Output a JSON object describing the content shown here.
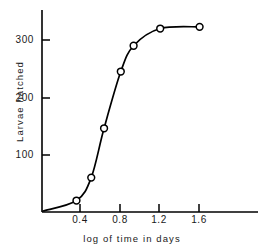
{
  "chart_data": {
    "type": "line",
    "title": "",
    "subtitle": "",
    "xlabel": "log of time in days",
    "ylabel": "Larvae hatched",
    "xlim": [
      0.0,
      1.78
    ],
    "ylim": [
      0,
      368
    ],
    "grid": false,
    "legend": null,
    "marker": "open-circle",
    "line_color": "#000000",
    "marker_fill": "#ffffff",
    "axis_color": "#000000",
    "x": [
      0.35,
      0.5,
      0.63,
      0.8,
      0.93,
      1.2,
      1.6
    ],
    "values": [
      20,
      60,
      146,
      245,
      290,
      320,
      323
    ],
    "series": [
      {
        "name": "Larvae hatched",
        "x": [
          0.35,
          0.5,
          0.63,
          0.8,
          0.93,
          1.2,
          1.6
        ],
        "values": [
          20,
          60,
          146,
          245,
          290,
          320,
          323
        ]
      }
    ],
    "xticks": [
      0.4,
      0.8,
      1.2,
      1.6
    ],
    "xtick_labels": [
      "0.4",
      "0.8",
      "1.2",
      "1.6"
    ],
    "yticks": [
      100,
      200,
      300
    ],
    "ytick_labels": [
      "100",
      "200",
      "300"
    ],
    "annotations": []
  },
  "axis": {
    "x_title": "log of time in days",
    "y_title": "Larvae hatched",
    "xtick_0": "0.4",
    "xtick_1": "0.8",
    "xtick_2": "1.2",
    "xtick_3": "1.6",
    "ytick_0": "100",
    "ytick_1": "200",
    "ytick_2": "300"
  }
}
